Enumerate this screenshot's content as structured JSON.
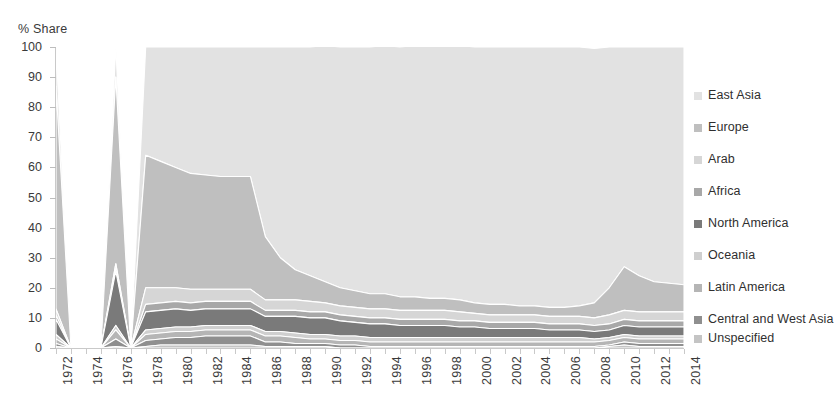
{
  "chart_data": {
    "type": "area",
    "stacked": true,
    "title": "",
    "ylabel": "% Share",
    "xlabel": "",
    "ylim": [
      0,
      100
    ],
    "yticks": [
      0,
      10,
      20,
      30,
      40,
      50,
      60,
      70,
      80,
      90,
      100
    ],
    "grid": false,
    "legend_position": "right",
    "x": [
      1972,
      1973,
      1974,
      1975,
      1976,
      1977,
      1978,
      1979,
      1980,
      1981,
      1982,
      1983,
      1984,
      1985,
      1986,
      1987,
      1988,
      1989,
      1990,
      1991,
      1992,
      1993,
      1994,
      1995,
      1996,
      1997,
      1998,
      1999,
      2000,
      2001,
      2002,
      2003,
      2004,
      2005,
      2006,
      2007,
      2008,
      2009,
      2010,
      2011,
      2012,
      2013,
      2014
    ],
    "xtick_labels": [
      "1972",
      "1974",
      "1976",
      "1978",
      "1980",
      "1982",
      "1984",
      "1986",
      "1988",
      "1990",
      "1992",
      "1994",
      "1996",
      "1998",
      "2000",
      "2002",
      "2004",
      "2006",
      "2008",
      "2010",
      "2012",
      "2014"
    ],
    "series": [
      {
        "name": "East Asia",
        "color": "#e2e2e2",
        "values": [
          13.0,
          0.0,
          0.0,
          0.0,
          10.0,
          0.0,
          36.0,
          38.0,
          40.0,
          42.0,
          42.5,
          43.0,
          43.0,
          43.0,
          63.0,
          70.0,
          74.0,
          76.0,
          78.5,
          80.0,
          81.0,
          82.0,
          82.5,
          83.0,
          83.5,
          84.0,
          84.0,
          84.5,
          85.0,
          85.5,
          85.5,
          86.0,
          86.0,
          86.5,
          86.5,
          86.0,
          84.5,
          80.0,
          73.0,
          76.0,
          78.0,
          78.5,
          79.0
        ]
      },
      {
        "name": "Europe",
        "color": "#bfbfbf",
        "values": [
          74.0,
          0.0,
          0.0,
          0.0,
          62.0,
          0.0,
          44.0,
          42.0,
          40.0,
          38.5,
          38.0,
          37.5,
          37.5,
          37.5,
          21.0,
          14.0,
          10.0,
          8.5,
          7.0,
          6.0,
          5.5,
          5.0,
          5.0,
          4.5,
          4.5,
          4.0,
          4.0,
          4.0,
          3.5,
          3.5,
          3.5,
          3.0,
          3.0,
          3.0,
          3.0,
          3.5,
          5.0,
          9.0,
          14.5,
          12.0,
          10.0,
          9.5,
          9.0
        ]
      },
      {
        "name": "Arab",
        "color": "#d6d6d6",
        "values": [
          2.0,
          0.0,
          0.0,
          0.0,
          1.5,
          0.0,
          5.5,
          5.0,
          4.5,
          4.5,
          4.0,
          4.0,
          4.0,
          4.0,
          3.5,
          3.5,
          3.5,
          3.5,
          3.0,
          3.0,
          3.0,
          3.0,
          3.0,
          3.0,
          3.0,
          3.0,
          3.0,
          3.0,
          2.5,
          2.5,
          2.5,
          2.5,
          2.5,
          2.5,
          2.5,
          2.5,
          2.5,
          3.0,
          3.0,
          3.0,
          3.0,
          3.0,
          3.0
        ]
      },
      {
        "name": "Africa",
        "color": "#a8a8a8",
        "values": [
          1.5,
          0.0,
          0.0,
          0.0,
          1.0,
          0.0,
          2.5,
          2.5,
          2.5,
          2.5,
          2.5,
          2.5,
          2.5,
          2.5,
          2.0,
          2.0,
          2.0,
          2.0,
          2.0,
          2.0,
          2.0,
          2.0,
          2.0,
          2.0,
          2.0,
          2.0,
          2.0,
          2.0,
          2.0,
          2.0,
          2.0,
          2.0,
          2.0,
          2.0,
          2.0,
          2.0,
          2.0,
          2.0,
          2.0,
          2.0,
          2.0,
          2.0,
          2.0
        ]
      },
      {
        "name": "North America",
        "color": "#7a7a7a",
        "values": [
          5.0,
          0.0,
          0.0,
          0.0,
          18.0,
          0.0,
          6.0,
          6.0,
          6.0,
          5.5,
          5.5,
          5.5,
          5.5,
          5.5,
          5.0,
          5.0,
          5.5,
          5.5,
          5.5,
          5.0,
          4.5,
          4.5,
          4.5,
          4.0,
          4.0,
          4.0,
          4.0,
          3.5,
          3.5,
          3.0,
          3.0,
          3.0,
          3.0,
          2.5,
          2.5,
          2.5,
          2.5,
          2.5,
          3.0,
          3.0,
          3.0,
          3.0,
          3.0
        ]
      },
      {
        "name": "Oceania",
        "color": "#cfcfcf",
        "values": [
          1.5,
          0.0,
          0.0,
          0.0,
          1.5,
          0.0,
          1.5,
          1.5,
          1.5,
          1.5,
          1.5,
          1.5,
          1.5,
          1.5,
          1.5,
          1.5,
          1.5,
          1.5,
          1.5,
          1.5,
          1.5,
          1.5,
          1.5,
          1.5,
          1.5,
          1.5,
          1.5,
          1.5,
          1.5,
          1.5,
          1.5,
          1.5,
          1.5,
          1.5,
          1.5,
          1.5,
          1.0,
          1.0,
          1.0,
          1.0,
          1.0,
          1.0,
          1.0
        ]
      },
      {
        "name": "Latin America",
        "color": "#b5b5b5",
        "values": [
          1.5,
          0.0,
          0.0,
          0.0,
          3.0,
          0.0,
          2.0,
          2.0,
          2.0,
          2.0,
          2.0,
          2.0,
          2.0,
          2.0,
          2.0,
          2.0,
          2.0,
          1.5,
          1.5,
          1.5,
          1.5,
          1.5,
          1.5,
          1.5,
          1.5,
          1.5,
          1.5,
          1.5,
          1.5,
          1.5,
          1.5,
          1.5,
          1.5,
          1.5,
          1.5,
          1.5,
          1.5,
          1.5,
          1.5,
          1.5,
          1.5,
          1.5,
          1.5
        ]
      },
      {
        "name": "Central and West Asia",
        "color": "#8f8f8f",
        "values": [
          1.0,
          0.0,
          0.0,
          0.0,
          2.5,
          0.0,
          2.0,
          2.0,
          2.5,
          2.5,
          3.0,
          3.0,
          3.0,
          3.0,
          1.5,
          1.5,
          1.0,
          1.0,
          1.0,
          1.0,
          1.0,
          0.5,
          0.5,
          0.5,
          0.5,
          0.5,
          0.5,
          0.5,
          0.5,
          0.5,
          0.5,
          0.5,
          0.5,
          0.5,
          0.5,
          0.5,
          0.5,
          0.5,
          1.0,
          1.0,
          1.0,
          1.0,
          1.0
        ]
      },
      {
        "name": "Unspecified",
        "color": "#c4c4c4",
        "values": [
          0.5,
          0.0,
          0.0,
          0.0,
          0.5,
          0.0,
          0.5,
          1.0,
          1.0,
          1.0,
          1.0,
          1.0,
          1.0,
          1.0,
          0.5,
          0.5,
          0.5,
          0.5,
          0.5,
          0.0,
          0.0,
          0.0,
          0.0,
          0.0,
          0.0,
          0.0,
          0.0,
          0.0,
          0.0,
          0.0,
          0.0,
          0.0,
          0.0,
          0.0,
          0.0,
          0.0,
          0.0,
          0.5,
          1.0,
          0.5,
          0.5,
          0.5,
          0.5
        ]
      }
    ]
  }
}
